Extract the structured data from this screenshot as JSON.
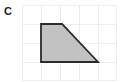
{
  "figure": {
    "label": "C",
    "caption": "",
    "type": "geometry-figure"
  },
  "colors": {
    "background": "#ffffff",
    "grid_line": "#e9e9e9",
    "grid_border": "#ededed",
    "shape_fill": "#c2c2c2",
    "shape_stroke": "#2b2b2b",
    "label_text": "#1a1a1a"
  },
  "grid": {
    "columns": 5,
    "rows": 4,
    "cell_size": 19,
    "origin_x": 22,
    "origin_y": 5,
    "visible": true,
    "x_lines": [
      22,
      41,
      60,
      79,
      98,
      117
    ],
    "y_lines": [
      5,
      24,
      43,
      62,
      81
    ]
  },
  "chart_data": {
    "type": "diagram",
    "title": "C",
    "shape": "trapezoid",
    "vertex_count": 4,
    "vertices_px": [
      [
        41,
        24
      ],
      [
        62,
        24
      ],
      [
        98,
        62
      ],
      [
        41,
        62
      ]
    ],
    "vertices_grid": [
      [
        1,
        1
      ],
      [
        2,
        1
      ],
      [
        4,
        3
      ],
      [
        1,
        3
      ]
    ],
    "edges": [
      {
        "name": "top",
        "from": [
          1,
          1
        ],
        "to": [
          2,
          1
        ],
        "length_units": 1
      },
      {
        "name": "right-slant",
        "from": [
          2,
          1
        ],
        "to": [
          4,
          3
        ],
        "length_units": 2.83
      },
      {
        "name": "bottom",
        "from": [
          4,
          3
        ],
        "to": [
          1,
          3
        ],
        "length_units": 3
      },
      {
        "name": "left",
        "from": [
          1,
          3
        ],
        "to": [
          1,
          1
        ],
        "length_units": 2
      }
    ],
    "area_units": 4,
    "grid_on": true,
    "legend": false
  },
  "polygon": {
    "points": "41,24 62,24 98,62 41,62",
    "stroke_width": 1.8
  }
}
